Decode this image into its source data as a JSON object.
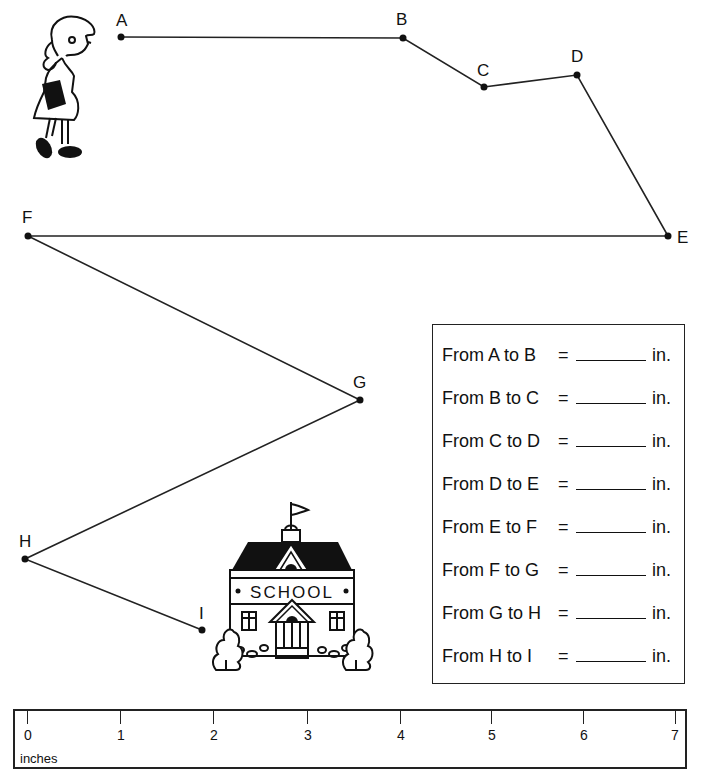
{
  "points": [
    {
      "name": "A",
      "x": 121,
      "y": 37,
      "lx": 116,
      "ly": 12
    },
    {
      "name": "B",
      "x": 403,
      "y": 38,
      "lx": 396,
      "ly": 11
    },
    {
      "name": "C",
      "x": 484,
      "y": 87,
      "lx": 477,
      "ly": 62
    },
    {
      "name": "D",
      "x": 577,
      "y": 75,
      "lx": 571,
      "ly": 49
    },
    {
      "name": "E",
      "x": 668,
      "y": 236,
      "lx": 677,
      "ly": 229
    },
    {
      "name": "F",
      "x": 28,
      "y": 236,
      "lx": 22,
      "ly": 209
    },
    {
      "name": "G",
      "x": 360,
      "y": 400,
      "lx": 353,
      "ly": 374
    },
    {
      "name": "H",
      "x": 25,
      "y": 559,
      "lx": 19,
      "ly": 533
    },
    {
      "name": "I",
      "x": 202,
      "y": 630,
      "lx": 199,
      "ly": 605
    }
  ],
  "labels": {
    "A": "A",
    "B": "B",
    "C": "C",
    "D": "D",
    "E": "E",
    "F": "F",
    "G": "G",
    "H": "H",
    "I": "I"
  },
  "answers": [
    {
      "label": "From A to B",
      "eq": "=",
      "unit": "in."
    },
    {
      "label": "From B to C",
      "eq": "=",
      "unit": "in."
    },
    {
      "label": "From C to D",
      "eq": "=",
      "unit": "in."
    },
    {
      "label": "From D to E",
      "eq": "=",
      "unit": "in."
    },
    {
      "label": "From E to F",
      "eq": "=",
      "unit": "in."
    },
    {
      "label": "From F to G",
      "eq": "=",
      "unit": "in."
    },
    {
      "label": "From G to H",
      "eq": "=",
      "unit": "in."
    },
    {
      "label": "From H to I",
      "eq": "=",
      "unit": "in."
    }
  ],
  "ruler": {
    "unit": "inches",
    "ticks": [
      "0",
      "1",
      "2",
      "3",
      "4",
      "5",
      "6",
      "7"
    ]
  },
  "school_sign": "SCHOOL",
  "colors": {
    "ink": "#111111",
    "paper": "#ffffff"
  }
}
